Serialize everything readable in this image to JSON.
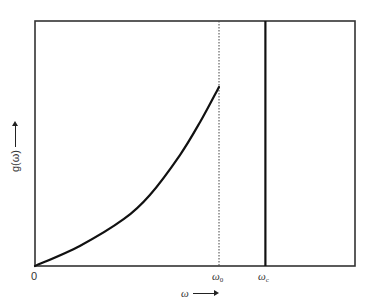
{
  "chart_data": {
    "type": "line",
    "title": "",
    "xlabel": "ω",
    "ylabel": "g(ω)",
    "x_ticks": [
      {
        "label": "0",
        "x": 0
      },
      {
        "label": "ω0",
        "main": "ω",
        "sub": "0",
        "x": 0.575
      },
      {
        "label": "ωc",
        "main": "ω",
        "sub": "c",
        "x": 0.72
      }
    ],
    "xlim": [
      0,
      1
    ],
    "ylim": [
      0,
      1
    ],
    "grid": false,
    "legend": null,
    "series": [
      {
        "name": "g(ω) density of states",
        "style": "solid-thick",
        "x": [
          0.0,
          0.14,
          0.278,
          0.359,
          0.453,
          0.516,
          0.575
        ],
        "y": [
          0.0,
          0.082,
          0.192,
          0.29,
          0.453,
          0.588,
          0.731
        ]
      }
    ],
    "annotations": [
      {
        "type": "vline",
        "x": 0.575,
        "style": "dotted",
        "label": "ω0"
      },
      {
        "type": "vline",
        "x": 0.72,
        "style": "solid-thick",
        "label": "ωc"
      }
    ]
  },
  "labels": {
    "origin": "0",
    "omega_0_main": "ω",
    "omega_0_sub": "0",
    "omega_c_main": "ω",
    "omega_c_sub": "c",
    "x_axis": "ω",
    "y_axis": "g(ω)"
  },
  "plot": {
    "left": 35,
    "top": 21,
    "right": 355,
    "bottom": 266,
    "frame_color": "#333333",
    "curve_color": "#111111"
  }
}
